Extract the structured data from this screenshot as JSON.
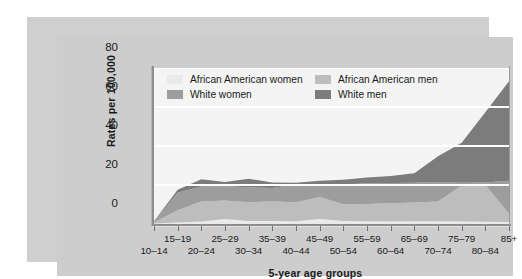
{
  "chart_data": {
    "type": "area",
    "stacked": true,
    "title": "",
    "subtitle": "",
    "xlabel": "5-year age groups",
    "ylabel": "Rates per 100,000",
    "ylim": [
      0,
      80
    ],
    "yticks": [
      0,
      20,
      40,
      60,
      80
    ],
    "grid": "horizontal",
    "grid_color": "#ffffff",
    "legend_position": "top-left-inside",
    "categories": [
      "10–14",
      "15–19",
      "20–24",
      "25–29",
      "30–34",
      "35–39",
      "40–44",
      "45–49",
      "50–54",
      "55–59",
      "60–64",
      "65–69",
      "70–74",
      "75–79",
      "80–84",
      "85+"
    ],
    "series": [
      {
        "name": "African American women",
        "color": "#eaeaea",
        "values": [
          0.3,
          0.8,
          1.3,
          2.6,
          1.6,
          1.5,
          1.4,
          2.6,
          1.5,
          1.4,
          1.3,
          1.4,
          1.4,
          1.3,
          1.2,
          1.0
        ]
      },
      {
        "name": "African American men",
        "color": "#bdbdbd",
        "values": [
          0.5,
          6.2,
          10.3,
          9.4,
          9.6,
          10.0,
          9.8,
          11.2,
          8.6,
          8.9,
          9.3,
          9.6,
          10.1,
          18.4,
          18.9,
          4.2
        ]
      },
      {
        "name": "White women",
        "color": "#9d9d9d",
        "values": [
          0.4,
          9.0,
          7.6,
          7.4,
          7.6,
          7.0,
          9.0,
          5.8,
          10.1,
          10.6,
          10.4,
          10.2,
          10.1,
          1.5,
          1.2,
          17.0
        ]
      },
      {
        "name": "White men",
        "color": "#7c7c7c",
        "values": [
          0.2,
          1.6,
          3.8,
          2.2,
          4.4,
          2.8,
          1.0,
          2.6,
          2.5,
          3.0,
          3.6,
          4.8,
          13.1,
          20.5,
          36.0,
          51.0
        ]
      }
    ],
    "totals": [
      1.4,
      17.6,
      23.0,
      21.6,
      23.2,
      21.3,
      21.2,
      22.2,
      22.7,
      23.9,
      24.6,
      26.0,
      34.7,
      41.7,
      57.3,
      73.2
    ]
  },
  "legend": {
    "entries": [
      {
        "label": "African American women",
        "swatch": "#eaeaea"
      },
      {
        "label": "African American men",
        "swatch": "#bdbdbd"
      },
      {
        "label": "White women",
        "swatch": "#9d9d9d"
      },
      {
        "label": "White men",
        "swatch": "#7c7c7c"
      }
    ]
  },
  "axis": {
    "y_title": "Rates per 100,000",
    "x_title": "5-year age groups",
    "y_ticks": [
      "0",
      "20",
      "40",
      "60",
      "80"
    ]
  }
}
